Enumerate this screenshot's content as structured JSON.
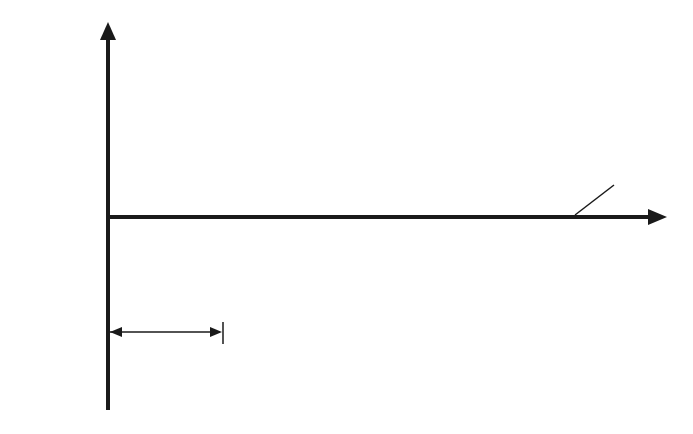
{
  "diagram": {
    "axes": {
      "y_label": "V",
      "x_label": "t",
      "side_label_line1": "Output",
      "side_label_line2": "voltage"
    },
    "annotations": {
      "vd_symbol": "V",
      "vd_subscript": "D",
      "vd_value": " = 0",
      "alpha_label": "α"
    },
    "waveforms": {
      "phase_curves": 6,
      "phase_spacing_deg": 60,
      "style": "dashed sinusoids",
      "output_style": "solid sawtooth segments",
      "shaded_regions": 2
    },
    "colors": {
      "line": "#1a1a1a",
      "shade": "#d9d9d9",
      "background": "#ffffff"
    }
  }
}
